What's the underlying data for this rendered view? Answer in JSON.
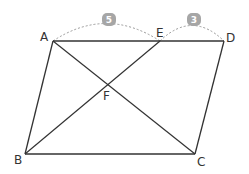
{
  "diagram": {
    "type": "parallelogram-geometry",
    "points": {
      "A": {
        "label": "A",
        "x": 53,
        "y": 41
      },
      "E": {
        "label": "E",
        "x": 160,
        "y": 41
      },
      "D": {
        "label": "D",
        "x": 224,
        "y": 41
      },
      "B": {
        "label": "B",
        "x": 25,
        "y": 154
      },
      "C": {
        "label": "C",
        "x": 195,
        "y": 154
      },
      "F": {
        "label": "F",
        "x": 107,
        "y": 85
      }
    },
    "segments": [
      "AD",
      "DC",
      "CB",
      "BA",
      "AC",
      "BE"
    ],
    "measures": [
      {
        "segment": "AE",
        "value": "5"
      },
      {
        "segment": "ED",
        "value": "3"
      }
    ],
    "colors": {
      "line": "#333333",
      "badge": "#a6a6a6",
      "arc": "#999999"
    }
  }
}
